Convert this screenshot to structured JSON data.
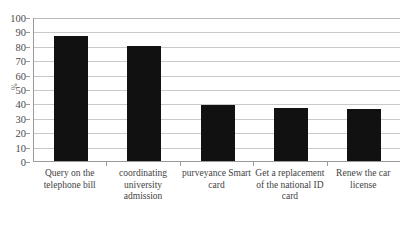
{
  "chart_data": {
    "type": "bar",
    "title": "",
    "xlabel": "",
    "ylabel": "%",
    "categories": [
      "Query on the telephone bill",
      "coordinating university admission",
      "purveyance Smart card",
      "Get a replacement of the national ID card",
      "Renew the car license"
    ],
    "values": [
      87,
      80,
      39,
      37,
      36
    ],
    "ylim": [
      0,
      100
    ],
    "ytick_labels": [
      "0",
      "10",
      "20",
      "30",
      "40",
      "50",
      "60",
      "70",
      "80",
      "90",
      "100"
    ],
    "ytick_values": [
      0,
      10,
      20,
      30,
      40,
      50,
      60,
      70,
      80,
      90,
      100
    ],
    "grid": true,
    "grid_orientation": "horizontal",
    "legend": false,
    "legend_position": "none",
    "bar_color": "#111111",
    "grid_color": "#c9c9c9",
    "axis_color": "#9a9a9a",
    "background_color": "#ffffff"
  }
}
